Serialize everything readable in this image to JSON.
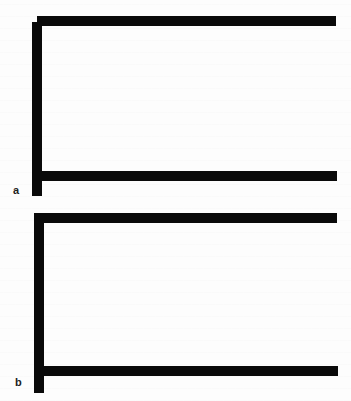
{
  "figure": {
    "background_color": "#fdfdfd",
    "stroke_color": "#0a0a0a",
    "panels": [
      {
        "id": "a",
        "label": "a",
        "shape": "bracket with top bar offset above vertical (notched corner)",
        "top_bar": {
          "x": 37,
          "y": 16,
          "width": 299,
          "height": 10
        },
        "bottom_bar": {
          "x": 42,
          "y": 171,
          "width": 295,
          "height": 10
        },
        "vertical_bar": {
          "x": 32,
          "y": 22,
          "width": 10,
          "height": 174
        }
      },
      {
        "id": "b",
        "label": "b",
        "shape": "bracket with flush top-left corner",
        "top_bar": {
          "x": 34,
          "y": 213,
          "width": 303,
          "height": 10
        },
        "bottom_bar": {
          "x": 44,
          "y": 366,
          "width": 294,
          "height": 10
        },
        "vertical_bar": {
          "x": 34,
          "y": 213,
          "width": 10,
          "height": 180
        }
      }
    ]
  }
}
